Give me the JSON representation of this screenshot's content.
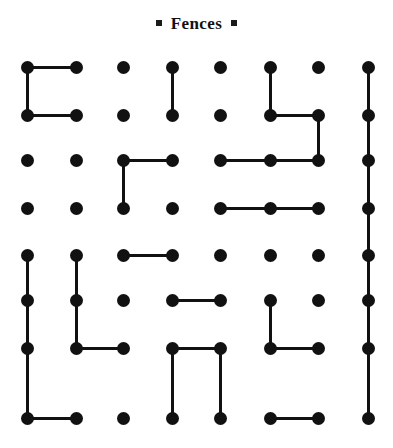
{
  "header": {
    "title": "Fences",
    "left_bullet": "square-bullet",
    "right_bullet": "square-bullet"
  },
  "puzzle": {
    "name": "Fences",
    "type": "dot-grid-loop-puzzle",
    "columns": 8,
    "rows": 8,
    "dot_color": "#111111",
    "line_color": "#111111",
    "background_color": "#ffffff",
    "dot_diameter_px": 13,
    "line_thickness_px": 3,
    "col_x": [
      27,
      76,
      123,
      172,
      220,
      270,
      318,
      368
    ],
    "row_y": [
      67,
      115,
      160,
      208,
      255,
      300,
      348,
      418
    ],
    "horizontal_edges": [
      {
        "row": 0,
        "from_col": 0,
        "to_col": 1
      },
      {
        "row": 1,
        "from_col": 0,
        "to_col": 1
      },
      {
        "row": 1,
        "from_col": 5,
        "to_col": 6
      },
      {
        "row": 2,
        "from_col": 2,
        "to_col": 3
      },
      {
        "row": 2,
        "from_col": 4,
        "to_col": 5
      },
      {
        "row": 2,
        "from_col": 5,
        "to_col": 6
      },
      {
        "row": 3,
        "from_col": 4,
        "to_col": 5
      },
      {
        "row": 3,
        "from_col": 5,
        "to_col": 6
      },
      {
        "row": 4,
        "from_col": 2,
        "to_col": 3
      },
      {
        "row": 5,
        "from_col": 3,
        "to_col": 4
      },
      {
        "row": 6,
        "from_col": 1,
        "to_col": 2
      },
      {
        "row": 6,
        "from_col": 3,
        "to_col": 4
      },
      {
        "row": 6,
        "from_col": 5,
        "to_col": 6
      },
      {
        "row": 7,
        "from_col": 0,
        "to_col": 1
      },
      {
        "row": 7,
        "from_col": 5,
        "to_col": 6
      }
    ],
    "vertical_edges": [
      {
        "col": 0,
        "from_row": 0,
        "to_row": 1
      },
      {
        "col": 3,
        "from_row": 0,
        "to_row": 1
      },
      {
        "col": 5,
        "from_row": 0,
        "to_row": 1
      },
      {
        "col": 7,
        "from_row": 0,
        "to_row": 1
      },
      {
        "col": 6,
        "from_row": 1,
        "to_row": 2
      },
      {
        "col": 7,
        "from_row": 1,
        "to_row": 2
      },
      {
        "col": 2,
        "from_row": 2,
        "to_row": 3
      },
      {
        "col": 7,
        "from_row": 2,
        "to_row": 3
      },
      {
        "col": 7,
        "from_row": 3,
        "to_row": 4
      },
      {
        "col": 0,
        "from_row": 4,
        "to_row": 5
      },
      {
        "col": 1,
        "from_row": 4,
        "to_row": 5
      },
      {
        "col": 7,
        "from_row": 4,
        "to_row": 5
      },
      {
        "col": 0,
        "from_row": 5,
        "to_row": 6
      },
      {
        "col": 1,
        "from_row": 5,
        "to_row": 6
      },
      {
        "col": 5,
        "from_row": 5,
        "to_row": 6
      },
      {
        "col": 7,
        "from_row": 5,
        "to_row": 6
      },
      {
        "col": 0,
        "from_row": 6,
        "to_row": 7
      },
      {
        "col": 3,
        "from_row": 6,
        "to_row": 7
      },
      {
        "col": 4,
        "from_row": 6,
        "to_row": 7
      },
      {
        "col": 7,
        "from_row": 6,
        "to_row": 7
      }
    ]
  }
}
